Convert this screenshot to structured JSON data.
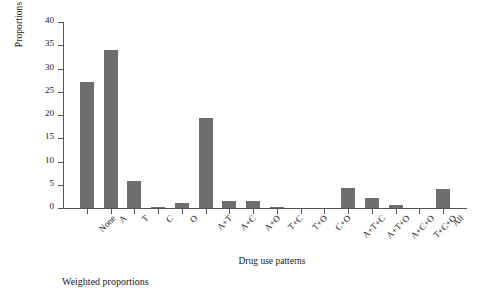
{
  "chart_data": {
    "type": "bar",
    "title": "",
    "xlabel": "Drug use patterns",
    "ylabel": "Proportions (%)",
    "caption": "Weighted proportions",
    "ylim": [
      0,
      40
    ],
    "yticks": [
      0,
      5,
      10,
      15,
      20,
      25,
      30,
      35,
      40
    ],
    "grid": false,
    "legend": "none",
    "bar_color": "#6e6e6e",
    "axis_color": "#555555",
    "categories": [
      "None",
      "A",
      "T",
      "C",
      "O",
      "A+T",
      "A+C",
      "A+O",
      "T+C",
      "T+O",
      "C+O",
      "A+T+C",
      "A+T+O",
      "A+C+O",
      "T+C+O",
      "All"
    ],
    "values": [
      27.0,
      34.0,
      5.8,
      0.2,
      1.0,
      19.4,
      1.6,
      1.5,
      0.3,
      0.0,
      0.0,
      4.2,
      2.2,
      0.7,
      0.0,
      4.1
    ]
  }
}
